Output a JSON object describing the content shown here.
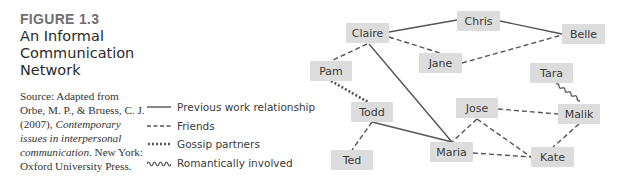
{
  "figure": {
    "label": "FIGURE 1.3",
    "title": "An Informal Communication Network",
    "source_prefix": "Source: Adapted from Orbe, M. P., & Bruess, C. J. (2007), ",
    "source_italic": "Contemporary issues in interpersonal communication",
    "source_suffix": ". New York: Oxford University Press."
  },
  "legend": [
    {
      "style": "solid",
      "label": "Previous work relationship"
    },
    {
      "style": "dashed",
      "label": "Friends"
    },
    {
      "style": "dotted",
      "label": "Gossip partners"
    },
    {
      "style": "wavy",
      "label": "Romantically involved"
    }
  ],
  "nodes": {
    "claire": "Claire",
    "chris": "Chris",
    "belle": "Belle",
    "jane": "Jane",
    "pam": "Pam",
    "tara": "Tara",
    "todd": "Todd",
    "jose": "Jose",
    "malik": "Malik",
    "ted": "Ted",
    "maria": "Maria",
    "kate": "Kate"
  },
  "edges": [
    {
      "from": "Claire",
      "to": "Chris",
      "type": "solid"
    },
    {
      "from": "Chris",
      "to": "Belle",
      "type": "solid"
    },
    {
      "from": "Claire",
      "to": "Maria",
      "type": "solid"
    },
    {
      "from": "Todd",
      "to": "Maria",
      "type": "solid"
    },
    {
      "from": "Claire",
      "to": "Jane",
      "type": "dashed"
    },
    {
      "from": "Claire",
      "to": "Pam",
      "type": "dashed"
    },
    {
      "from": "Jane",
      "to": "Belle",
      "type": "dashed"
    },
    {
      "from": "Todd",
      "to": "Ted",
      "type": "dashed"
    },
    {
      "from": "Jose",
      "to": "Maria",
      "type": "dashed"
    },
    {
      "from": "Jose",
      "to": "Malik",
      "type": "dashed"
    },
    {
      "from": "Jose",
      "to": "Kate",
      "type": "dashed"
    },
    {
      "from": "Maria",
      "to": "Kate",
      "type": "dashed"
    },
    {
      "from": "Malik",
      "to": "Kate",
      "type": "dashed"
    },
    {
      "from": "Pam",
      "to": "Todd",
      "type": "dotted"
    },
    {
      "from": "Tara",
      "to": "Malik",
      "type": "wavy"
    }
  ],
  "colors": {
    "node_fill": "#dcdcdc",
    "line": "#555555",
    "text": "#3a3a3a"
  }
}
